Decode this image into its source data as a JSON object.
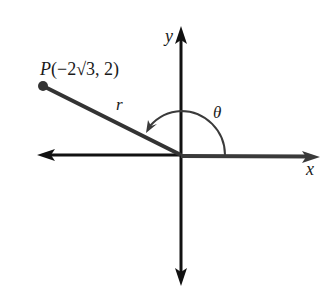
{
  "diagram": {
    "type": "polar-angle-in-standard-position",
    "axes": {
      "x_label": "x",
      "y_label": "y"
    },
    "point": {
      "name": "P",
      "label": "P(−2√3, 2)",
      "label_prefix": "P",
      "label_coords": "(−2√3, 2)",
      "x": "−2√3",
      "y": "2"
    },
    "radius_label": "r",
    "angle_label": "θ",
    "colors": {
      "axis": "#111111",
      "terminal_side": "#333333",
      "arc": "#3a3a3a",
      "background": "#ffffff"
    }
  }
}
